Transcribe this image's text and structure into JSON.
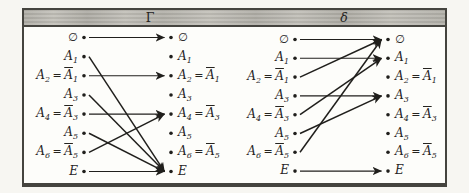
{
  "figure": {
    "type": "mapping-diagram",
    "description_visible_text_only": true,
    "colors": {
      "ink": "#201f1c",
      "band": "#c6c4bd",
      "border": "#45443f",
      "paper": "#fdfdfa"
    },
    "nodes": [
      {
        "segments": [
          {
            "t": "∅",
            "nullset": true
          }
        ]
      },
      {
        "segments": [
          {
            "t": "A",
            "frak": true,
            "sub": "1"
          }
        ]
      },
      {
        "segments": [
          {
            "t": "A",
            "frak": true,
            "sub": "2"
          },
          {
            "t": "=",
            "op": true
          },
          {
            "t": "A",
            "frak": true,
            "bar": true,
            "sub": "1"
          }
        ]
      },
      {
        "segments": [
          {
            "t": "A",
            "frak": true,
            "sub": "3"
          }
        ]
      },
      {
        "segments": [
          {
            "t": "A",
            "frak": true,
            "sub": "4"
          },
          {
            "t": "=",
            "op": true
          },
          {
            "t": "A",
            "frak": true,
            "bar": true,
            "sub": "3"
          }
        ]
      },
      {
        "segments": [
          {
            "t": "A",
            "frak": true,
            "sub": "5"
          }
        ]
      },
      {
        "segments": [
          {
            "t": "A",
            "frak": true,
            "sub": "6"
          },
          {
            "t": "=",
            "op": true
          },
          {
            "t": "A",
            "frak": true,
            "bar": true,
            "sub": "5"
          }
        ]
      },
      {
        "segments": [
          {
            "t": "E"
          }
        ]
      }
    ],
    "panels": [
      {
        "title": "Γ",
        "mappings": [
          {
            "from": 0,
            "to": 0
          },
          {
            "from": 1,
            "to": 7
          },
          {
            "from": 2,
            "to": 2
          },
          {
            "from": 3,
            "to": 7
          },
          {
            "from": 4,
            "to": 4
          },
          {
            "from": 5,
            "to": 7
          },
          {
            "from": 6,
            "to": 4
          },
          {
            "from": 7,
            "to": 7
          }
        ]
      },
      {
        "title": "δ",
        "mappings": [
          {
            "from": 0,
            "to": 0
          },
          {
            "from": 1,
            "to": 1
          },
          {
            "from": 2,
            "to": 0
          },
          {
            "from": 3,
            "to": 3
          },
          {
            "from": 4,
            "to": 1
          },
          {
            "from": 5,
            "to": 3
          },
          {
            "from": 6,
            "to": 0
          },
          {
            "from": 7,
            "to": 7
          }
        ]
      }
    ]
  }
}
